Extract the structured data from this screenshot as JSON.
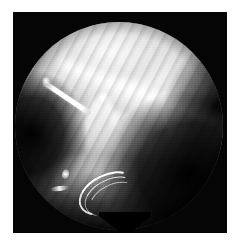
{
  "figure": {
    "kind": "photograph",
    "modality": "endoscopic-video-frame",
    "color_mode": "grayscale",
    "caption": "",
    "label": "",
    "frame": {
      "page_background": "#ffffff",
      "matte_color": "#050505",
      "border_left_px": 13,
      "border_top_px": 12,
      "plate_width_px": 214,
      "plate_height_px": 221
    },
    "field_of_view": {
      "shape": "circle",
      "diameter_px": 208,
      "center_x_px": 119,
      "center_y_px": 126,
      "bottom_notch": true
    },
    "tones": {
      "highlight": "#ffffff",
      "bright_tissue": "#e9e9e9",
      "mid_tissue": "#8f8f8f",
      "shadow": "#242424",
      "black": "#050505"
    },
    "features": [
      {
        "name": "bright-tissue-sheet-upper",
        "position": "upper-center",
        "tone": "#e9e9e9"
      },
      {
        "name": "diagonal-tissue-fold",
        "position": "upper-right-to-center",
        "tone": "#f5f5f5"
      },
      {
        "name": "central-duct-column",
        "position": "center",
        "tone": "#fafafa"
      },
      {
        "name": "branching-limb",
        "position": "center-right",
        "tone": "#f0f0f0"
      },
      {
        "name": "junction-node-highlight",
        "position": "center",
        "tone": "#ffffff"
      },
      {
        "name": "surgical-needle-probe",
        "position": "upper-left",
        "tone": "#ffffff"
      },
      {
        "name": "banded-suture-loops",
        "position": "lower-center",
        "tone": "#ffffff"
      },
      {
        "name": "specular-highlight-dot",
        "position": "lower-left",
        "tone": "#ffffff"
      },
      {
        "name": "dark-cavity-left",
        "position": "left",
        "tone": "#0a0a0a"
      },
      {
        "name": "dark-cavity-lower-right",
        "position": "lower-right",
        "tone": "#0a0a0a"
      },
      {
        "name": "tissue-plane-striations",
        "position": "right",
        "tone": "#3a3a3a"
      }
    ]
  }
}
